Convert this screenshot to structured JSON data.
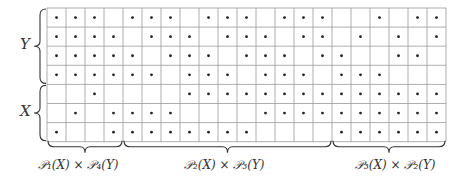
{
  "diagram": {
    "row_labels": [
      {
        "label": "Y",
        "rows": [
          0,
          3
        ]
      },
      {
        "label": "X",
        "rows": [
          4,
          6
        ]
      }
    ],
    "column_groups": [
      {
        "label": "𝒫₁(X) × 𝒫₄(Y)",
        "cols": [
          0,
          3
        ]
      },
      {
        "label": "𝒫₂(X) × 𝒫₃(Y)",
        "cols": [
          4,
          14
        ]
      },
      {
        "label": "𝒫₃(X) × 𝒫₂(Y)",
        "cols": [
          15,
          20
        ]
      }
    ],
    "grid": {
      "rows": 7,
      "cols": 21,
      "cells": [
        [
          1,
          1,
          1,
          0,
          1,
          1,
          1,
          0,
          1,
          1,
          1,
          0,
          1,
          1,
          1,
          0,
          0,
          1,
          0,
          1,
          1
        ],
        [
          1,
          1,
          1,
          1,
          0,
          1,
          1,
          1,
          0,
          1,
          1,
          1,
          0,
          1,
          1,
          0,
          1,
          0,
          1,
          0,
          1
        ],
        [
          1,
          1,
          1,
          1,
          1,
          0,
          1,
          1,
          1,
          0,
          1,
          1,
          1,
          0,
          1,
          1,
          0,
          0,
          1,
          1,
          0
        ],
        [
          1,
          1,
          1,
          1,
          1,
          1,
          0,
          1,
          1,
          1,
          0,
          1,
          1,
          1,
          0,
          1,
          1,
          1,
          0,
          0,
          0
        ],
        [
          0,
          0,
          1,
          0,
          0,
          0,
          0,
          1,
          1,
          1,
          1,
          1,
          1,
          1,
          1,
          1,
          1,
          1,
          1,
          1,
          1
        ],
        [
          0,
          1,
          0,
          1,
          1,
          1,
          1,
          0,
          0,
          0,
          0,
          1,
          1,
          1,
          1,
          1,
          1,
          1,
          1,
          1,
          1
        ],
        [
          1,
          0,
          0,
          1,
          1,
          1,
          1,
          1,
          1,
          1,
          1,
          0,
          0,
          0,
          0,
          1,
          1,
          1,
          1,
          1,
          1
        ]
      ]
    },
    "colors": {
      "grid_line": "#9a9a9a",
      "dot": "#222222",
      "brace": "#333333"
    }
  }
}
